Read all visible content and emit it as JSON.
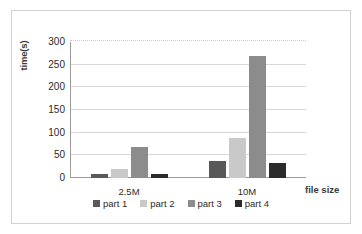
{
  "chart_data": {
    "type": "bar",
    "title": "",
    "subtitle": "",
    "xlabel": "file size",
    "ylabel": "time(s)",
    "categories": [
      "2.5M",
      "10M"
    ],
    "series": [
      {
        "name": "part 1",
        "values": [
          8,
          37
        ],
        "color": "#595959"
      },
      {
        "name": "part 2",
        "values": [
          20,
          88
        ],
        "color": "#c9c9c9"
      },
      {
        "name": "part 3",
        "values": [
          68,
          270
        ],
        "color": "#8c8c8c"
      },
      {
        "name": "part 4",
        "values": [
          9,
          34
        ],
        "color": "#2b2b2b"
      }
    ],
    "ylim": [
      0,
      300
    ],
    "ytick_values": [
      0,
      50,
      100,
      150,
      200,
      250,
      300
    ],
    "ytick_labels": [
      "0",
      "50",
      "100",
      "150",
      "200",
      "250",
      "300"
    ],
    "grid": true,
    "grid_axis": "y",
    "legend_position": "bottom",
    "legend_entries": [
      "part 1",
      "part 2",
      "part 3",
      "part 4"
    ],
    "annotations": []
  },
  "axes": {
    "y_title": "time(s)",
    "x_title": "file size"
  },
  "frame": {
    "border_color": "#d2d2d2",
    "background_color": "#ffffff",
    "gridline_color": "#d8d8d8",
    "axis_color": "#9a9a9a"
  }
}
